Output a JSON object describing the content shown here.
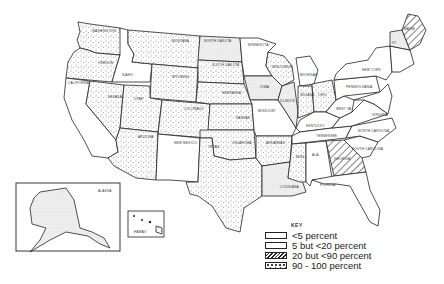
{
  "map": {
    "title": "",
    "key": {
      "title": "KEY",
      "items": [
        {
          "label": "<5 percent",
          "pattern": "none"
        },
        {
          "label": "5 but <20 percent",
          "pattern": "fine-dots"
        },
        {
          "label": "20 but <90 percent",
          "pattern": "hatch"
        },
        {
          "label": "90 - 100 percent",
          "pattern": "stipple"
        }
      ]
    },
    "states": {
      "washington": "WASHINGTON",
      "oregon": "OREGON",
      "california": "CALIFORNIA",
      "idaho": "IDAHO",
      "nevada": "NEVADA",
      "montana": "MONTANA",
      "wyoming": "WYOMING",
      "utah": "UTAH",
      "arizona": "ARIZONA",
      "colorado": "COLORADO",
      "new_mexico": "NEW MEXICO",
      "north_dakota": "NORTH DAKOTA",
      "south_dakota": "SOUTH DAKOTA",
      "nebraska": "NEBRASKA",
      "kansas": "KANSAS",
      "oklahoma": "OKLAHOMA",
      "texas": "TEXAS",
      "minnesota": "MINNESOTA",
      "iowa": "IOWA",
      "missouri": "MISSOURI",
      "arkansas": "ARKANSAS",
      "louisiana": "LOUISIANA",
      "wisconsin": "WISCONSIN",
      "illinois": "ILLINOIS",
      "michigan": "MICHIGAN",
      "indiana": "INDIANA",
      "ohio": "OHIO",
      "kentucky": "KENTUCKY",
      "tennessee": "TENNESSEE",
      "mississippi": "MISS.",
      "alabama": "ALA.",
      "georgia": "GEORGIA",
      "florida": "FLORIDA",
      "south_carolina": "SOUTH CAROLINA",
      "north_carolina": "NORTH CAROLINA",
      "virginia": "VIRGINIA",
      "west_virginia": "WEST VA.",
      "pennsylvania": "PENNSYLVANIA",
      "new_york": "NEW YORK",
      "maine": "MAINE",
      "vermont": "VT.",
      "alaska": "ALASKA",
      "hawaii": "HAWAII"
    }
  }
}
